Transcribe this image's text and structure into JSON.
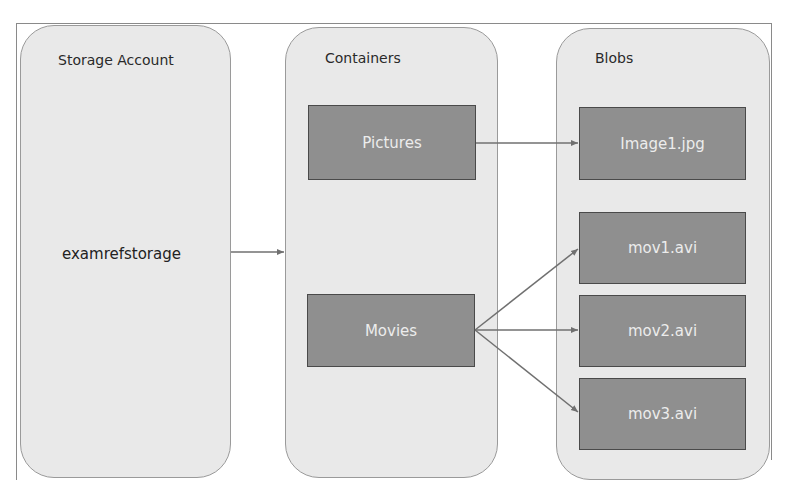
{
  "diagram": {
    "columns": [
      {
        "title": "Storage Account",
        "items": [
          "examrefstorage"
        ]
      },
      {
        "title": "Containers",
        "items": [
          "Pictures",
          "Movies"
        ]
      },
      {
        "title": "Blobs",
        "items": [
          "Image1.jpg",
          "mov1.avi",
          "mov2.avi",
          "mov3.avi"
        ]
      }
    ],
    "edges": [
      {
        "from": "examrefstorage",
        "to": "Containers"
      },
      {
        "from": "Pictures",
        "to": "Image1.jpg"
      },
      {
        "from": "Movies",
        "to": "mov1.avi"
      },
      {
        "from": "Movies",
        "to": "mov2.avi"
      },
      {
        "from": "Movies",
        "to": "mov3.avi"
      }
    ],
    "colors": {
      "panel_fill": "#e9e9e9",
      "box_fill": "#8f8f8f",
      "box_text": "#ececec",
      "arrow": "#707070"
    }
  }
}
